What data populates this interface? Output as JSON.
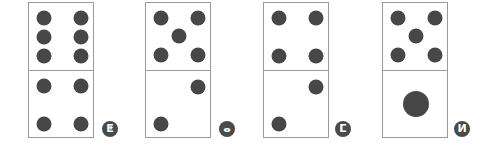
{
  "figure": {
    "dot_color": "#474747",
    "border_color": "#9a9a9a",
    "options": [
      {
        "label": "ⵟ",
        "label_icon": "option-a-marker",
        "left": 28,
        "label_pos": [
          102,
          121
        ],
        "top_dots": 6,
        "bottom_dots": 4,
        "top": [
          [
            15,
            15
          ],
          [
            52,
            15
          ],
          [
            15,
            34
          ],
          [
            52,
            34
          ],
          [
            15,
            53
          ],
          [
            52,
            53
          ]
        ],
        "bottom": [
          [
            15,
            15
          ],
          [
            52,
            15
          ],
          [
            15,
            53
          ],
          [
            52,
            53
          ]
        ]
      },
      {
        "label": "ⴰ",
        "label_icon": "option-b-marker",
        "left": 145,
        "label_pos": [
          219,
          121
        ],
        "top_dots": 5,
        "bottom_dots": 2,
        "top": [
          [
            15,
            15
          ],
          [
            52,
            15
          ],
          [
            33,
            33
          ],
          [
            15,
            52
          ],
          [
            52,
            52
          ]
        ],
        "bottom": [
          [
            52,
            16
          ],
          [
            15,
            53
          ]
        ]
      },
      {
        "label": "ⵎ",
        "label_icon": "option-c-marker",
        "left": 263,
        "label_pos": [
          335,
          121
        ],
        "top_dots": 4,
        "bottom_dots": 2,
        "top": [
          [
            15,
            15
          ],
          [
            52,
            15
          ],
          [
            15,
            53
          ],
          [
            52,
            53
          ]
        ],
        "bottom": [
          [
            52,
            16
          ],
          [
            15,
            53
          ]
        ]
      },
      {
        "label": "ⵍ",
        "label_icon": "option-d-marker",
        "left": 382,
        "label_pos": [
          454,
          121
        ],
        "top_dots": 5,
        "bottom_dots": 1,
        "top": [
          [
            15,
            15
          ],
          [
            52,
            15
          ],
          [
            33,
            33
          ],
          [
            15,
            52
          ],
          [
            52,
            52
          ]
        ],
        "bottom_big": [
          [
            33,
            33
          ]
        ]
      }
    ]
  }
}
